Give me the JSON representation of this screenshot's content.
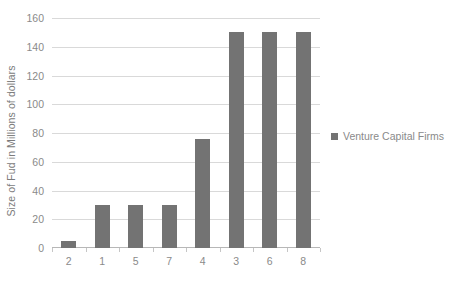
{
  "chart_data": {
    "type": "bar",
    "title": "",
    "subtitle": "",
    "xlabel": "",
    "ylabel": "Size of Fud in Millions of dollars",
    "categories": [
      "2",
      "1",
      "5",
      "7",
      "4",
      "3",
      "6",
      "8"
    ],
    "series": [
      {
        "name": "Venture Capital Firms",
        "values": [
          5,
          30,
          30,
          30,
          76,
          150,
          150,
          150
        ],
        "color": "#737373"
      }
    ],
    "ylim": [
      0,
      160
    ],
    "ytick_values": [
      0,
      20,
      40,
      60,
      80,
      100,
      120,
      140,
      160
    ],
    "ytick_labels": [
      "0",
      "20",
      "40",
      "60",
      "80",
      "100",
      "120",
      "140",
      "160"
    ],
    "grid": true,
    "grid_axis": "y",
    "grid_color": "#d9d9d9",
    "legend": {
      "position": "right",
      "entries": [
        {
          "label": "Venture Capital Firms",
          "marker": "square-marker",
          "color": "#737373"
        }
      ]
    },
    "background_color": "#ffffff",
    "text_color": "#8a8a8a"
  }
}
